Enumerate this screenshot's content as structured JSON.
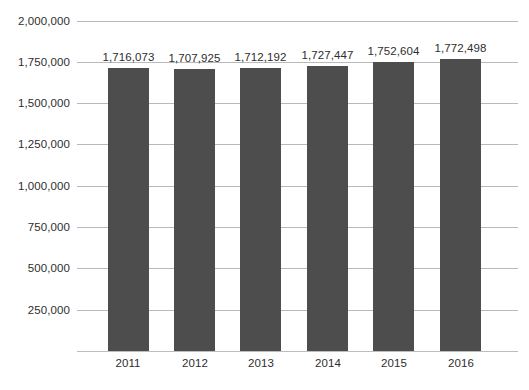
{
  "chart_data": {
    "type": "bar",
    "title": "",
    "xlabel": "",
    "ylabel": "",
    "categories": [
      "2011",
      "2012",
      "2013",
      "2014",
      "2015",
      "2016"
    ],
    "values": [
      1716073,
      1707925,
      1712192,
      1727447,
      1752604,
      1772498
    ],
    "value_labels": [
      "1,716,073",
      "1,707,925",
      "1,712,192",
      "1,727,447",
      "1,752,604",
      "1,772,498"
    ],
    "ylim": [
      0,
      2000000
    ],
    "y_ticks": [
      2000000,
      1750000,
      1500000,
      1250000,
      1000000,
      750000,
      500000,
      250000
    ],
    "y_tick_labels": [
      "2,000,000",
      "1,750,000",
      "1,500,000",
      "1,250,000",
      "1,000,000",
      "750,000",
      "500,000",
      "250,000"
    ],
    "grid": true,
    "legend": false,
    "bar_color": "#4d4d4d",
    "gridline_color": "#b9b9b9",
    "background_color": "#ffffff"
  }
}
